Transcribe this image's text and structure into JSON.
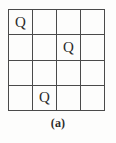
{
  "figure": {
    "caption": "(a)",
    "grid": {
      "rows": 4,
      "columns": 4,
      "line_color": "#4a4a4a",
      "background_color": "#fdfdfc"
    },
    "piece_symbol": "Q",
    "cells": [
      [
        {
          "symbol": "Q",
          "occupied": true,
          "row": 1,
          "col": 1
        },
        {
          "symbol": "",
          "occupied": false,
          "row": 1,
          "col": 2
        },
        {
          "symbol": "",
          "occupied": false,
          "row": 1,
          "col": 3
        },
        {
          "symbol": "",
          "occupied": false,
          "row": 1,
          "col": 4
        }
      ],
      [
        {
          "symbol": "",
          "occupied": false,
          "row": 2,
          "col": 1
        },
        {
          "symbol": "",
          "occupied": false,
          "row": 2,
          "col": 2
        },
        {
          "symbol": "Q",
          "occupied": true,
          "row": 2,
          "col": 3
        },
        {
          "symbol": "",
          "occupied": false,
          "row": 2,
          "col": 4
        }
      ],
      [
        {
          "symbol": "",
          "occupied": false,
          "row": 3,
          "col": 1
        },
        {
          "symbol": "",
          "occupied": false,
          "row": 3,
          "col": 2
        },
        {
          "symbol": "",
          "occupied": false,
          "row": 3,
          "col": 3
        },
        {
          "symbol": "",
          "occupied": false,
          "row": 3,
          "col": 4
        }
      ],
      [
        {
          "symbol": "",
          "occupied": false,
          "row": 4,
          "col": 1
        },
        {
          "symbol": "Q",
          "occupied": true,
          "row": 4,
          "col": 2
        },
        {
          "symbol": "",
          "occupied": false,
          "row": 4,
          "col": 3
        },
        {
          "symbol": "",
          "occupied": false,
          "row": 4,
          "col": 4
        }
      ]
    ]
  }
}
